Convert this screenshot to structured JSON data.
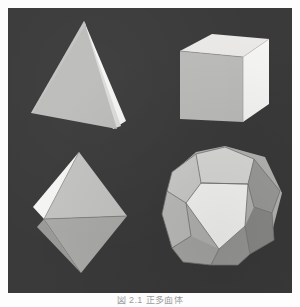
{
  "figure": {
    "caption": "図 2.1  正多面体",
    "plate_background": "#3a3a3a",
    "page_background": "#fdfdfd"
  },
  "palette": {
    "background": "#3a3a3a",
    "face_white": "#f2f2f0",
    "face_light": "#d4d4d2",
    "face_mid": "#bdbdbb",
    "face_medium": "#ababa9",
    "face_dark": "#8e8e8c",
    "face_darker": "#7c7c7a",
    "edge": "#6f6f6d"
  },
  "solids": [
    {
      "name": "tetrahedron",
      "label": "Tetrahedron",
      "faces": 4,
      "position": "top-left",
      "visible_faces": [
        {
          "id": "tetra-front-left",
          "shade": "#bdbdbb",
          "points": "84,21 33,113 115,127"
        },
        {
          "id": "tetra-right",
          "shade": "#f2f2f0",
          "points": "84,21 115,127 120,119"
        },
        {
          "id": "tetra-right-thin",
          "shade": "#d9d9d7",
          "points": "84,21 120,119 112,112"
        }
      ]
    },
    {
      "name": "cube",
      "label": "Cube (Hexahedron)",
      "faces": 6,
      "position": "top-right",
      "visible_faces": [
        {
          "id": "cube-top",
          "shade": "#eceae8",
          "points": "181,51 214,35 268,39 242,57"
        },
        {
          "id": "cube-front",
          "shade": "#bdbdbb",
          "points": "181,51 242,57 242,122 181,119"
        },
        {
          "id": "cube-right",
          "shade": "#f4f4f2",
          "points": "242,57 268,39 268,105 242,122"
        }
      ]
    },
    {
      "name": "octahedron",
      "label": "Octahedron",
      "faces": 8,
      "position": "bottom-left",
      "visible_faces": [
        {
          "id": "octa-upper-right",
          "shade": "#c6c6c4",
          "points": "80,152 125,216 42,220"
        },
        {
          "id": "octa-upper-left-white",
          "shade": "#f4f4f2",
          "points": "80,152 42,220 35,206"
        },
        {
          "id": "octa-upper-left-2",
          "shade": "#e0e0de",
          "points": "80,152 35,206 40,214"
        },
        {
          "id": "octa-lower-right",
          "shade": "#ababa9",
          "points": "42,220 125,216 80,273"
        },
        {
          "id": "octa-lower-left",
          "shade": "#9a9a98",
          "points": "42,220 80,273 38,226"
        }
      ]
    },
    {
      "name": "dodecahedron",
      "label": "Dodecahedron",
      "faces": 12,
      "position": "bottom-right",
      "visible_faces": [
        {
          "id": "dodeca-front",
          "shade": "#f7f7f5",
          "points": "190,185 223,159 259,183 247,224 202,225"
        },
        {
          "id": "dodeca-top",
          "shade": "#d2d2d0",
          "points": "223,159 196,147 202,171"
        },
        {
          "id": "dodeca-top-pent",
          "shade": "#d8d8d6",
          "points": "190,185 196,154 224,147 252,158 259,183 223,159"
        },
        {
          "id": "dodeca-upper-left",
          "shade": "#cfcfcd",
          "points": "190,185 196,154 176,161 168,190 181,203"
        },
        {
          "id": "dodeca-upper-right",
          "shade": "#9e9e9c",
          "points": "259,183 252,158 272,163 279,191 266,203"
        },
        {
          "id": "dodeca-left",
          "shade": "#c2c2c0",
          "points": "190,185 181,203 190,231 202,225 202,225"
        },
        {
          "id": "dodeca-lower-left",
          "shade": "#b0b0ae",
          "points": "181,203 202,225 196,254 172,249 168,219"
        },
        {
          "id": "dodeca-lower-right",
          "shade": "#8e8e8c",
          "points": "247,224 266,203 277,218 268,246 250,252"
        },
        {
          "id": "dodeca-bottom",
          "shade": "#a5a5a3",
          "points": "202,225 247,224 250,252 224,266 196,254"
        }
      ]
    }
  ]
}
